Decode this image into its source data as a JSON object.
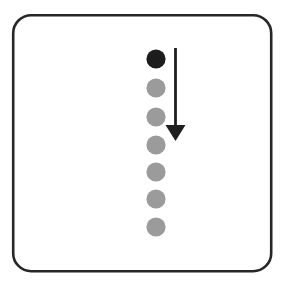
{
  "figure": {
    "title": "Downward progression of seven dots with arrow",
    "caption": "",
    "background_color": "#ffffff",
    "width": 284,
    "height": 285
  },
  "frame": {
    "name": "rounded-panel-border",
    "x": 13.2,
    "y": 15.2,
    "width": 258,
    "height": 256,
    "corner_radius": 18,
    "stroke_color": "#272727",
    "stroke_width": 2.6,
    "fill": "none"
  },
  "dots": {
    "count": 7,
    "center_x": 156,
    "radius": 9.6,
    "spacing": 28,
    "active_color": "#1c1c1c",
    "inactive_color": "#9b9b9b",
    "items": [
      {
        "label": "dot-1",
        "cy": 59,
        "state": "active",
        "color": "#1c1c1c"
      },
      {
        "label": "dot-2",
        "cy": 88,
        "state": "inactive",
        "color": "#9b9b9b"
      },
      {
        "label": "dot-3",
        "cy": 117,
        "state": "inactive",
        "color": "#9b9b9b"
      },
      {
        "label": "dot-4",
        "cy": 145,
        "state": "inactive",
        "color": "#9b9b9b"
      },
      {
        "label": "dot-5",
        "cy": 172,
        "state": "inactive",
        "color": "#9b9b9b"
      },
      {
        "label": "dot-6",
        "cy": 199,
        "state": "inactive",
        "color": "#9b9b9b"
      },
      {
        "label": "dot-7",
        "cy": 227,
        "state": "inactive",
        "color": "#9b9b9b"
      }
    ]
  },
  "arrow": {
    "name": "downward-arrow",
    "direction": "down",
    "color": "#1f1f1f",
    "shaft_x": 175.5,
    "shaft_top_y": 48,
    "shaft_bottom_y": 126,
    "shaft_width": 2.8,
    "head_left_x": 165.5,
    "head_right_x": 185.5,
    "head_top_y": 125,
    "head_tip_y": 141
  },
  "chart_data": {
    "type": "scatter",
    "title": "Downward progression of seven dots with arrow",
    "xlabel": "",
    "ylabel": "",
    "grid": false,
    "legend": "none",
    "xlim": [
      0,
      284
    ],
    "ylim": [
      285,
      0
    ],
    "series": [
      {
        "name": "dot-sequence",
        "x": [
          156,
          156,
          156,
          156,
          156,
          156,
          156
        ],
        "y": [
          59,
          88,
          117,
          145,
          172,
          199,
          227
        ],
        "marker": "circle",
        "marker_size": 19,
        "colors": [
          "#1c1c1c",
          "#9b9b9b",
          "#9b9b9b",
          "#9b9b9b",
          "#9b9b9b",
          "#9b9b9b",
          "#9b9b9b"
        ]
      }
    ],
    "annotations": [
      {
        "type": "arrow",
        "direction": "down",
        "x_start": 175.5,
        "y_start": 48,
        "x_end": 175.5,
        "y_end": 141,
        "color": "#1f1f1f"
      }
    ]
  }
}
